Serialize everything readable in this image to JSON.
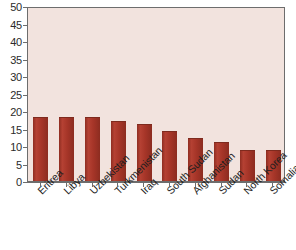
{
  "chart_data": {
    "type": "bar",
    "title": "",
    "subtitle": "",
    "xlabel": "",
    "ylabel": "",
    "categories": [
      "Eritrea",
      "Libya",
      "Uzbekistan",
      "Turkmenistan",
      "Iraq",
      "South Sudan",
      "Afghanistan",
      "Sudan",
      "North Korea",
      "Somalia"
    ],
    "values": [
      18,
      18,
      18,
      17,
      16,
      14,
      12,
      11,
      8.5,
      8.5
    ],
    "ylim": [
      0,
      50
    ],
    "ytick_step": 5,
    "ytick_labels": [
      "0",
      "5",
      "10",
      "15",
      "20",
      "25",
      "30",
      "35",
      "40",
      "45",
      "50"
    ],
    "grid": false,
    "legend": false,
    "legend_position": "none",
    "bar_color": "#a8372a",
    "plot_background_color": "#f2e3de",
    "axis_color": "#6d6d6d",
    "text_color": "#1e1e1e"
  }
}
